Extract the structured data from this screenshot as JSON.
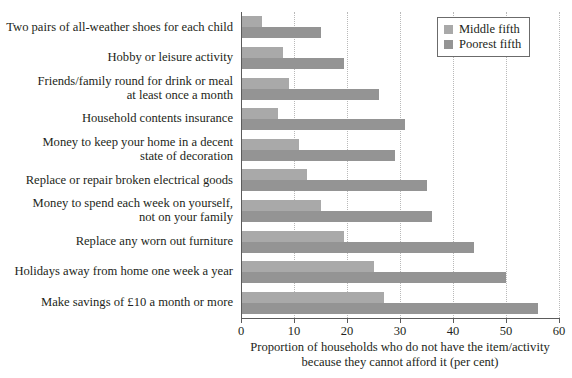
{
  "chart_data": {
    "type": "bar",
    "orientation": "horizontal",
    "title": "",
    "xlabel": "Proportion of households who do not have the item/activity\nbecause they cannot afford it (per cent)",
    "ylabel": "",
    "xlim": [
      0,
      60
    ],
    "xticks": [
      0,
      10,
      20,
      30,
      40,
      50,
      60
    ],
    "grid": "vertical-dotted",
    "legend_position": "top-right",
    "categories": [
      "Two pairs of all-weather shoes for each child",
      "Hobby or leisure activity",
      "Friends/family round for drink or meal\nat least once a month",
      "Household contents insurance",
      "Money to keep your home in a decent\nstate of decoration",
      "Replace or repair broken electrical goods",
      "Money to spend each week on yourself,\nnot on your family",
      "Replace any worn out furniture",
      "Holidays away from home one week a year",
      "Make savings of £10 a month or more"
    ],
    "series": [
      {
        "name": "Middle fifth",
        "color": "#a9a9a9",
        "values": [
          4,
          8,
          9,
          7,
          11,
          12.5,
          15,
          19.5,
          25,
          27
        ]
      },
      {
        "name": "Poorest fifth",
        "color": "#949494",
        "values": [
          15,
          19.5,
          26,
          31,
          29,
          35,
          36,
          44,
          50,
          56
        ]
      }
    ]
  },
  "legend": {
    "items": [
      {
        "label": "Middle fifth"
      },
      {
        "label": "Poorest fifth"
      }
    ]
  },
  "axis": {
    "tick_labels": [
      "0",
      "10",
      "20",
      "30",
      "40",
      "50",
      "60"
    ],
    "x_title": "Proportion of households who do not have the item/activity\nbecause they cannot afford it (per cent)"
  }
}
